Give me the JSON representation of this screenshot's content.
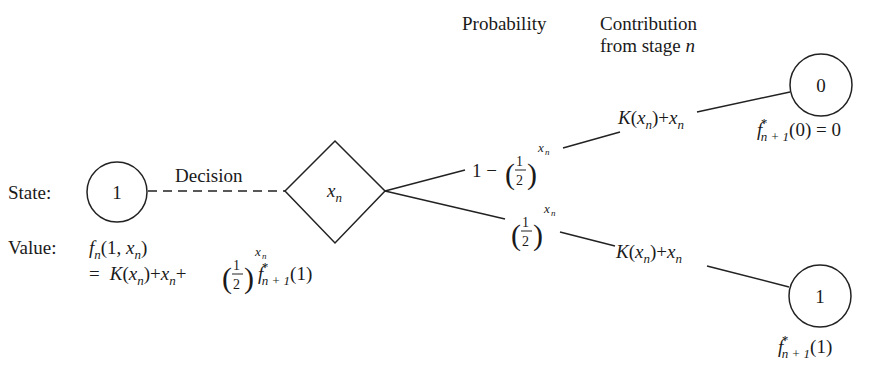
{
  "headers": {
    "probability": "Probability",
    "contribution_line1": "Contribution",
    "contribution_line2": "from stage",
    "contribution_var": "n"
  },
  "start_node": {
    "state_label": "State:",
    "state_value": "1",
    "value_label": "Value:",
    "value_expr_line1": "f_n(1, x_n)",
    "value_expr_line2": "= K(x_n)+x_n+(1/2)^{x_n} f*_{n+1}(1)"
  },
  "decision": {
    "label": "Decision",
    "node_value": "x",
    "node_sub": "n"
  },
  "branches": [
    {
      "probability": "1 − (1/2)^{x_n}",
      "prob_prefix": "1 −",
      "contribution": "K(x_n)+x_n",
      "next_state": "0",
      "next_value": "f*_{n+1}(0) = 0",
      "next_value_tail": "(0) = 0"
    },
    {
      "probability": "(1/2)^{x_n}",
      "contribution": "K(x_n)+x_n",
      "next_state": "1",
      "next_value": "f*_{n+1}(1)",
      "next_value_tail": "(1)"
    }
  ],
  "glyphs": {
    "f": "f",
    "n": "n",
    "x": "x",
    "K": "K",
    "star": "*",
    "n_plus_1": "n + 1",
    "half_num": "1",
    "half_den": "2",
    "lparen": "(",
    "rparen": ")",
    "open": "(",
    "close": ")",
    "plus": "+",
    "equals": "=",
    "comma_1": "1, "
  }
}
